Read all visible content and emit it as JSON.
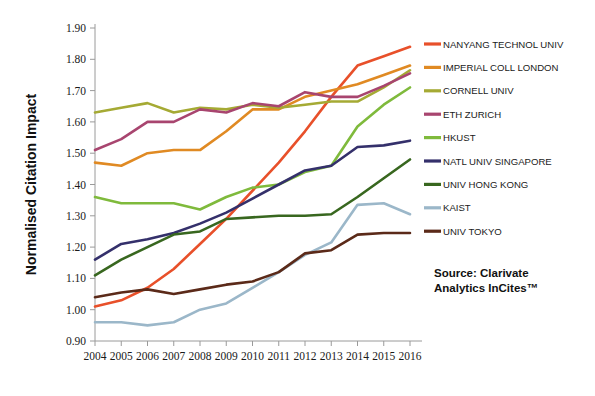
{
  "chart_data": {
    "type": "line",
    "title": "",
    "xlabel": "",
    "ylabel": "Normalised Citation Impact",
    "ylim": [
      0.9,
      1.9
    ],
    "ytick_step": 0.1,
    "grid": false,
    "legend_position": "right",
    "categories": [
      "2004",
      "2005",
      "2006",
      "2007",
      "2008",
      "2009",
      "2010",
      "2011",
      "2012",
      "2013",
      "2014",
      "2015",
      "2016"
    ],
    "yticks": [
      "0.90",
      "1.00",
      "1.10",
      "1.20",
      "1.30",
      "1.40",
      "1.50",
      "1.60",
      "1.70",
      "1.80",
      "1.90"
    ],
    "series": [
      {
        "name": "NANYANG TECHNOL UNIV",
        "color": "#E8502A",
        "values": [
          1.01,
          1.03,
          1.07,
          1.13,
          1.21,
          1.29,
          1.38,
          1.47,
          1.57,
          1.68,
          1.78,
          1.81,
          1.84
        ]
      },
      {
        "name": "IMPERIAL COLL LONDON",
        "color": "#E08A23",
        "values": [
          1.47,
          1.46,
          1.5,
          1.51,
          1.51,
          1.57,
          1.64,
          1.64,
          1.68,
          1.7,
          1.72,
          1.75,
          1.78
        ]
      },
      {
        "name": "CORNELL UNIV",
        "color": "#A5AA34",
        "values": [
          1.63,
          1.645,
          1.66,
          1.63,
          1.645,
          1.64,
          1.655,
          1.645,
          1.655,
          1.665,
          1.665,
          1.71,
          1.765
        ]
      },
      {
        "name": "ETH ZURICH",
        "color": "#A8456F",
        "values": [
          1.51,
          1.545,
          1.6,
          1.6,
          1.64,
          1.63,
          1.66,
          1.65,
          1.695,
          1.68,
          1.68,
          1.715,
          1.755
        ]
      },
      {
        "name": "HKUST",
        "color": "#7FBA3C",
        "values": [
          1.36,
          1.34,
          1.34,
          1.34,
          1.32,
          1.36,
          1.39,
          1.4,
          1.44,
          1.46,
          1.585,
          1.655,
          1.71
        ]
      },
      {
        "name": "NATL UNIV SINGAPORE",
        "color": "#34306B",
        "values": [
          1.16,
          1.21,
          1.225,
          1.245,
          1.275,
          1.31,
          1.355,
          1.4,
          1.445,
          1.46,
          1.52,
          1.525,
          1.54
        ]
      },
      {
        "name": "UNIV HONG KONG",
        "color": "#38671F",
        "values": [
          1.11,
          1.16,
          1.2,
          1.24,
          1.25,
          1.29,
          1.295,
          1.3,
          1.3,
          1.305,
          1.36,
          1.42,
          1.48
        ]
      },
      {
        "name": "KAIST",
        "color": "#9BB7C9",
        "values": [
          0.96,
          0.96,
          0.95,
          0.96,
          1.0,
          1.02,
          1.07,
          1.12,
          1.175,
          1.215,
          1.335,
          1.34,
          1.305
        ]
      },
      {
        "name": "UNIV TOKYO",
        "color": "#5B2A19",
        "values": [
          1.04,
          1.055,
          1.065,
          1.05,
          1.065,
          1.08,
          1.09,
          1.12,
          1.18,
          1.19,
          1.24,
          1.245,
          1.245
        ]
      }
    ]
  },
  "annotations": {
    "source_line1": "Source: Clarivate",
    "source_line2": "Analytics InCites™"
  }
}
